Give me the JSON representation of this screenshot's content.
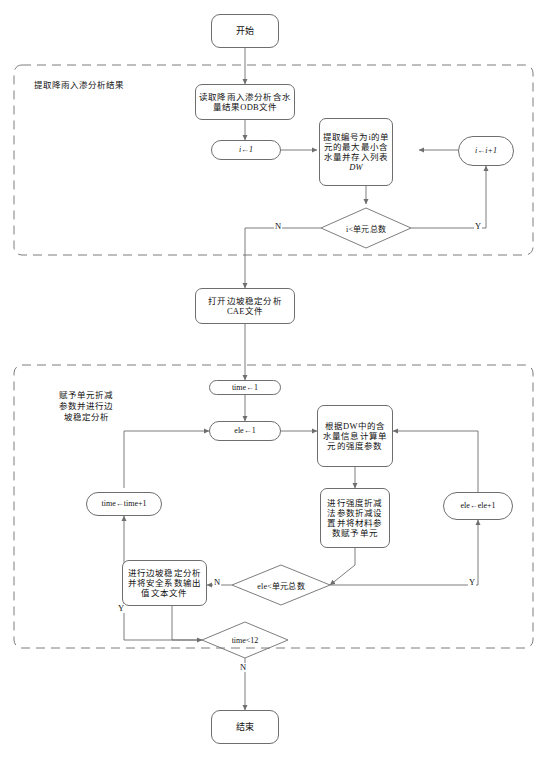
{
  "figure": {
    "type": "flowchart",
    "orientation": "vertical",
    "line_color": "#6e6e6e",
    "text_color": "#111111",
    "background": "#ffffff"
  },
  "groups": [
    {
      "id": "group-extract",
      "label": "提取降雨入渗分析结果",
      "style": "dashed"
    },
    {
      "id": "group-reduction",
      "label_lines": [
        "赋予单元折减",
        "参数并进行边",
        "坡稳定分析"
      ],
      "style": "dashed"
    }
  ],
  "nodes": {
    "start": {
      "shape": "terminal",
      "label": "开始"
    },
    "read_odb": {
      "shape": "process",
      "lines": [
        "读取降雨入渗分析含水",
        "量结果ODB文件"
      ]
    },
    "i_init": {
      "shape": "pill",
      "label": "i←1"
    },
    "extract_dw": {
      "shape": "process",
      "lines": [
        "提取编号为i的单",
        "元的最大最小含",
        "水量并存入列表",
        "DW"
      ]
    },
    "i_incr": {
      "shape": "pill",
      "label": "i←i+1"
    },
    "cond_i": {
      "shape": "decision",
      "label": "i<单元总数"
    },
    "open_cae": {
      "shape": "process",
      "lines": [
        "打开边坡稳定分析",
        "CAE文件"
      ]
    },
    "time_init": {
      "shape": "pill",
      "label": "time←1"
    },
    "ele_init": {
      "shape": "pill",
      "label": "ele←1"
    },
    "calc_strength": {
      "shape": "process",
      "lines": [
        "根据DW中的含",
        "水量信息计算单",
        "元的强度参数"
      ]
    },
    "srm_params": {
      "shape": "process",
      "lines": [
        "进行强度折减",
        "法参数折减设",
        "置并将材料参",
        "数赋予单元"
      ]
    },
    "time_incr": {
      "shape": "pill",
      "label": "time←time+1"
    },
    "ele_incr": {
      "shape": "pill",
      "label": "ele←ele+1"
    },
    "cond_ele": {
      "shape": "decision",
      "label": "ele<单元总数"
    },
    "run_slope": {
      "shape": "process",
      "lines": [
        "进行边坡稳定分析",
        "并将安全系数输出",
        "值文本文件"
      ]
    },
    "cond_time": {
      "shape": "decision",
      "label": "time<12"
    },
    "end": {
      "shape": "terminal",
      "label": "结束"
    }
  },
  "edge_labels": {
    "cond_i_no": "N",
    "cond_i_yes": "Y",
    "cond_ele_no": "N",
    "cond_ele_yes": "Y",
    "cond_time_yes": "Y",
    "cond_time_no": "N"
  }
}
